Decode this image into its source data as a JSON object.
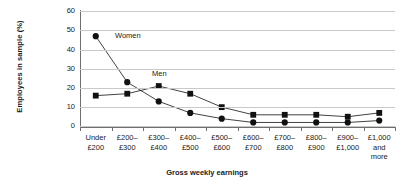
{
  "chart_data": {
    "type": "line",
    "title": "",
    "xlabel": "Gross weekly earnings",
    "ylabel": "Employees in sample (%)",
    "ylim": [
      0,
      60
    ],
    "yticks": [
      0,
      10,
      20,
      30,
      40,
      50,
      60
    ],
    "grid": true,
    "legend_position": "inline-annotations",
    "categories": [
      "Under\n£200",
      "£200–\n£300",
      "£300–\n£400",
      "£400–\n£500",
      "£500–\n£600",
      "£600–\n£700",
      "£700–\n£800",
      "£800–\n£900",
      "£900–\n£1,000",
      "£1,000\nand\nmore"
    ],
    "series": [
      {
        "name": "Women",
        "marker": "circle",
        "color": "#111111",
        "values": [
          47,
          23,
          13,
          7,
          4,
          2,
          2,
          2,
          2,
          3
        ]
      },
      {
        "name": "Men",
        "marker": "square",
        "color": "#111111",
        "values": [
          16,
          17,
          21,
          17,
          10,
          6,
          6,
          6,
          5,
          7
        ]
      }
    ],
    "annotations": [
      {
        "text": "Women",
        "series": "Women"
      },
      {
        "text": "Men",
        "series": "Men"
      }
    ]
  },
  "axis": {
    "y_title": "Employees in sample (%)",
    "x_title": "Gross weekly earnings",
    "y_tick_labels": [
      "0",
      "10",
      "20",
      "30",
      "40",
      "50",
      "60"
    ]
  }
}
